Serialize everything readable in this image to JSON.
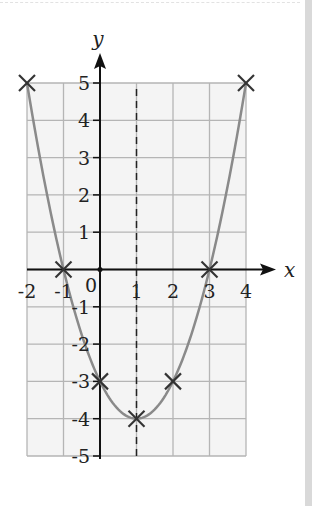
{
  "chart_data": {
    "type": "line",
    "title": "",
    "xlabel": "x",
    "ylabel": "y",
    "xlim": [
      -2,
      4
    ],
    "ylim": [
      -5,
      5
    ],
    "grid": true,
    "x_ticks": [
      -2,
      -1,
      0,
      1,
      2,
      3,
      4
    ],
    "y_ticks": [
      -5,
      -4,
      -3,
      -2,
      -1,
      1,
      2,
      3,
      4,
      5
    ],
    "origin_label": "0",
    "series": [
      {
        "name": "y = x^2 - 2x - 3",
        "type": "curve",
        "color": "#8a8a8a",
        "x": [
          -2,
          -1,
          0,
          1,
          2,
          3,
          4
        ],
        "y": [
          5,
          0,
          -3,
          -4,
          -3,
          0,
          5
        ]
      }
    ],
    "markers": [
      {
        "x": -2,
        "y": 5
      },
      {
        "x": -1,
        "y": 0
      },
      {
        "x": 0,
        "y": -3
      },
      {
        "x": 1,
        "y": -4
      },
      {
        "x": 2,
        "y": -3
      },
      {
        "x": 3,
        "y": 0
      },
      {
        "x": 4,
        "y": 5
      }
    ],
    "annotations": [
      {
        "type": "dashed-vertical-line",
        "x": 1,
        "label": "axis of symmetry"
      }
    ]
  },
  "labels": {
    "x_axis": "x",
    "y_axis": "y",
    "origin": "0",
    "x_ticks": [
      "-2",
      "-1",
      "1",
      "2",
      "3",
      "4"
    ],
    "y_ticks": [
      "5",
      "4",
      "3",
      "2",
      "1",
      "-1",
      "-2",
      "-3",
      "-4",
      "-5"
    ]
  },
  "colors": {
    "grid": "#b5b5b5",
    "grid_fill": "#f4f4f4",
    "axis": "#111111",
    "curve": "#8a8a8a",
    "marker": "#333333"
  }
}
